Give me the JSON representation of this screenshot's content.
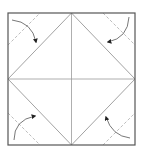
{
  "diagram": {
    "type": "origami-fold-diagram",
    "colors": {
      "outline": "#555555",
      "crease": "#9a9a9a",
      "fold_line": "#b0b0b0",
      "arrow": "#222222"
    },
    "square": {
      "x": 8,
      "y": 13,
      "size": 127
    },
    "steps": [
      {
        "corner": "top-left",
        "action": "fold-to-center"
      },
      {
        "corner": "top-right",
        "action": "fold-to-center"
      },
      {
        "corner": "bottom-left",
        "action": "fold-to-center"
      },
      {
        "corner": "bottom-right",
        "action": "fold-to-center"
      }
    ]
  }
}
